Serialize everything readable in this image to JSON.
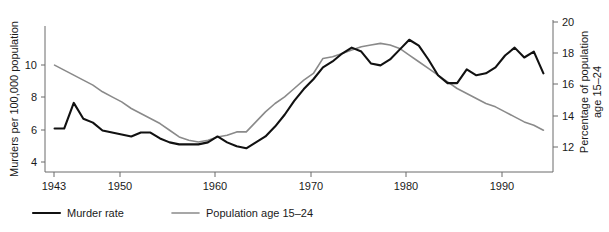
{
  "chart_data": {
    "type": "line",
    "title": "",
    "xlabel": "",
    "ylabel": "Murders per 100,000 population",
    "y2label": "Percentage of population age 15–24",
    "grid": false,
    "legend_position": "bottom-left",
    "xlim": [
      1942,
      1995
    ],
    "ylim": [
      3.5,
      11.2
    ],
    "y2lim": [
      11.3,
      20.4
    ],
    "xticks": [
      1943,
      1950,
      1960,
      1970,
      1980,
      1990
    ],
    "xtick_labels": [
      "1943",
      "1950",
      "1960",
      "1970",
      "1980",
      "1990"
    ],
    "yticks": [
      4,
      6,
      8,
      10
    ],
    "ytick_labels": [
      "4",
      "6",
      "8",
      "10"
    ],
    "y2ticks": [
      12,
      14,
      16,
      18,
      20
    ],
    "y2tick_labels": [
      "12",
      "14",
      "16",
      "18",
      "20"
    ],
    "x": [
      1943,
      1944,
      1945,
      1946,
      1947,
      1948,
      1949,
      1950,
      1951,
      1952,
      1953,
      1954,
      1955,
      1956,
      1957,
      1958,
      1959,
      1960,
      1961,
      1962,
      1963,
      1964,
      1965,
      1966,
      1967,
      1968,
      1969,
      1970,
      1971,
      1972,
      1973,
      1974,
      1975,
      1976,
      1977,
      1978,
      1979,
      1980,
      1981,
      1982,
      1983,
      1984,
      1985,
      1986,
      1987,
      1988,
      1989,
      1990,
      1991,
      1992,
      1993,
      1994
    ],
    "series": [
      {
        "name": "Murder rate",
        "axis": "left",
        "color": "#111111",
        "units": "murders per 100,000 population",
        "values": [
          5.7,
          5.7,
          7.0,
          6.2,
          6.0,
          5.6,
          5.5,
          5.4,
          5.3,
          5.5,
          5.5,
          5.2,
          5.0,
          4.9,
          4.9,
          4.9,
          5.0,
          5.3,
          5.0,
          4.8,
          4.7,
          5.0,
          5.3,
          5.8,
          6.4,
          7.1,
          7.7,
          8.2,
          8.8,
          9.1,
          9.5,
          9.8,
          9.6,
          9.0,
          8.9,
          9.2,
          9.7,
          10.2,
          9.9,
          9.2,
          8.4,
          8.0,
          8.0,
          8.7,
          8.4,
          8.5,
          8.8,
          9.4,
          9.8,
          9.3,
          9.6,
          8.5
        ]
      },
      {
        "name": "Population age 15–24",
        "axis": "right",
        "color": "#8a8a8a",
        "units": "percentage of population",
        "values": [
          17.7,
          17.4,
          17.1,
          16.8,
          16.5,
          16.1,
          15.8,
          15.5,
          15.1,
          14.8,
          14.5,
          14.2,
          13.8,
          13.4,
          13.2,
          13.1,
          13.2,
          13.4,
          13.5,
          13.7,
          13.7,
          14.3,
          14.9,
          15.4,
          15.8,
          16.3,
          16.8,
          17.2,
          18.1,
          18.2,
          18.4,
          18.6,
          18.8,
          18.9,
          19.0,
          18.9,
          18.7,
          18.3,
          17.9,
          17.5,
          17.1,
          16.7,
          16.3,
          16.0,
          15.7,
          15.4,
          15.2,
          14.9,
          14.6,
          14.3,
          14.1,
          13.8
        ]
      }
    ],
    "annotations": []
  },
  "axes": {
    "left_title": "Murders per 100,000 population",
    "right_title_line1": "Percentage of population",
    "right_title_line2": "age 15–24"
  },
  "legend": {
    "items": [
      {
        "label": "Murder rate",
        "color": "#111111"
      },
      {
        "label": "Population age 15–24",
        "color": "#8a8a8a"
      }
    ]
  }
}
